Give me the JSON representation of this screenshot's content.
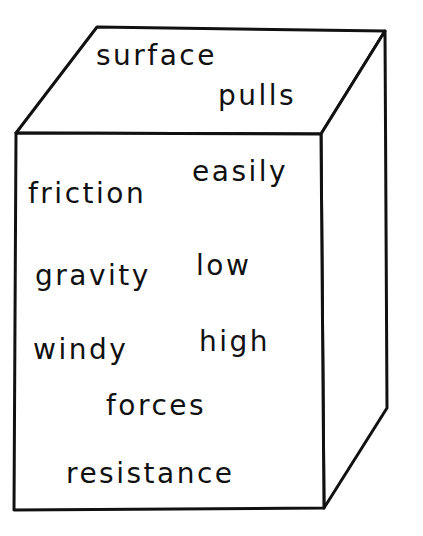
{
  "diagram": {
    "type": "word-cube",
    "stroke_color": "#111111",
    "background": "#ffffff",
    "top_face_words": [
      {
        "text": "surface",
        "x": 96,
        "y": 42
      },
      {
        "text": "pulls",
        "x": 218,
        "y": 82
      }
    ],
    "front_face_words": [
      {
        "text": "friction",
        "x": 28,
        "y": 180
      },
      {
        "text": "easily",
        "x": 192,
        "y": 158
      },
      {
        "text": "gravity",
        "x": 35,
        "y": 262
      },
      {
        "text": "low",
        "x": 196,
        "y": 252
      },
      {
        "text": "windy",
        "x": 33,
        "y": 336
      },
      {
        "text": "high",
        "x": 199,
        "y": 328
      },
      {
        "text": "forces",
        "x": 106,
        "y": 392
      },
      {
        "text": "resistance",
        "x": 66,
        "y": 460
      }
    ]
  }
}
